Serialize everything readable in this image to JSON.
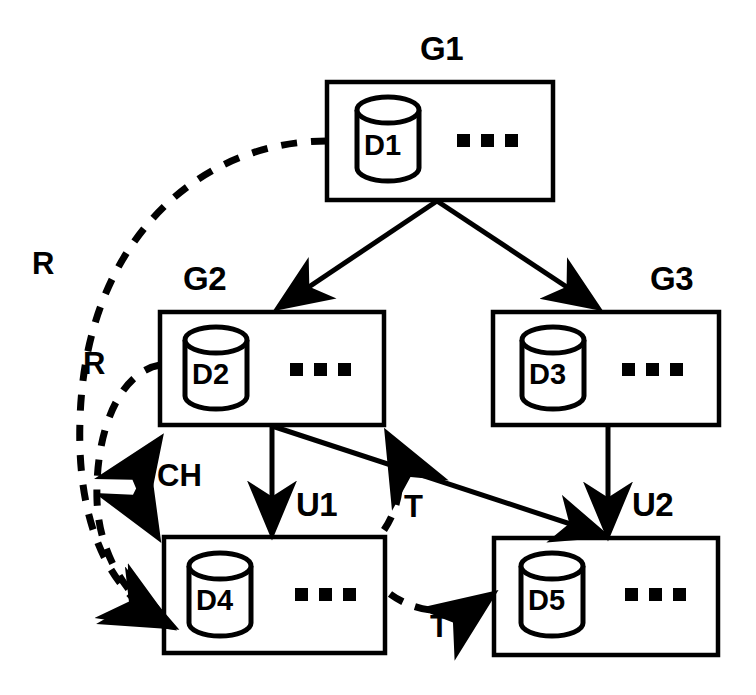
{
  "diagram": {
    "background_color": "#ffffff",
    "stroke_color": "#000000",
    "nodes": [
      {
        "id": "G1",
        "label": "G1",
        "db": "D1",
        "x": 327,
        "y": 82,
        "w": 226,
        "h": 118,
        "label_x": 420,
        "label_y": 38
      },
      {
        "id": "G2",
        "label": "G2",
        "db": "D2",
        "x": 160,
        "y": 312,
        "w": 224,
        "h": 113,
        "label_x": 183,
        "label_y": 268
      },
      {
        "id": "G3",
        "label": "G3",
        "db": "D3",
        "x": 493,
        "y": 312,
        "w": 226,
        "h": 113,
        "label_x": 650,
        "label_y": 268
      },
      {
        "id": "U1",
        "label": "U1",
        "db": "D4",
        "x": 164,
        "y": 537,
        "w": 221,
        "h": 116,
        "label_x": 295,
        "label_y": 493
      },
      {
        "id": "U2",
        "label": "U2",
        "db": "D5",
        "x": 494,
        "y": 538,
        "w": 224,
        "h": 117,
        "label_x": 632,
        "label_y": 493
      }
    ],
    "edges": [
      {
        "id": "g1-g2",
        "from": "G1",
        "to": "G2",
        "style": "solid",
        "label": ""
      },
      {
        "id": "g1-g3",
        "from": "G1",
        "to": "G3",
        "style": "solid",
        "label": ""
      },
      {
        "id": "g2-u1",
        "from": "G2",
        "to": "U1",
        "style": "solid",
        "label": ""
      },
      {
        "id": "g3-u2",
        "from": "G3",
        "to": "U2",
        "style": "solid",
        "label": ""
      },
      {
        "id": "g2-u2",
        "from": "G2",
        "to": "U2",
        "style": "solid",
        "label": ""
      },
      {
        "id": "r-outer",
        "from": "G1",
        "to": "U1",
        "style": "dashed",
        "label": "R",
        "label_x": 34,
        "label_y": 248
      },
      {
        "id": "r-inner",
        "from": "G2",
        "to": "U1",
        "style": "dashed",
        "label": "R",
        "label_x": 84,
        "label_y": 348
      },
      {
        "id": "ch",
        "from": "G2",
        "to": "U1",
        "style": "dashed",
        "label": "CH",
        "label_x": 158,
        "label_y": 460,
        "bidirectional": true
      },
      {
        "id": "t-vert",
        "from": "U1",
        "to": "G2",
        "style": "dashed",
        "label": "T",
        "label_x": 404,
        "label_y": 490
      },
      {
        "id": "t-horiz",
        "from": "U1",
        "to": "U2",
        "style": "dashed",
        "label": "T",
        "label_x": 432,
        "label_y": 610
      }
    ]
  }
}
